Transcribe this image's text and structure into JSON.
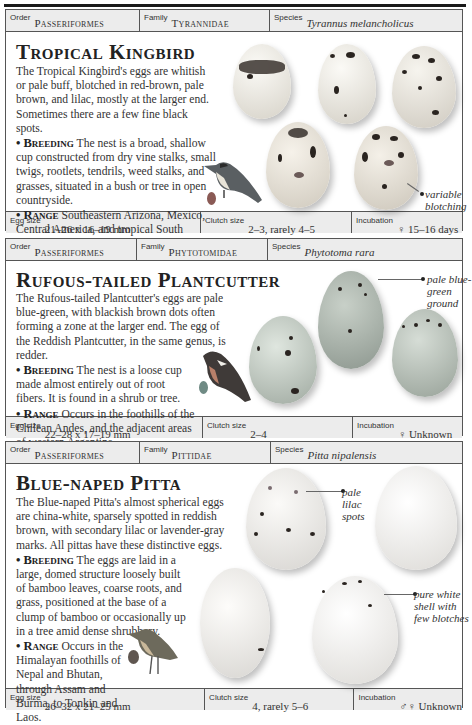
{
  "entries": [
    {
      "order_label": "Order",
      "order": "Passeriformes",
      "family_label": "Family",
      "family": "Tyrannidae",
      "species_label": "Species",
      "species": "Tyrannus melancholicus",
      "title": "Tropical Kingbird",
      "description": "The Tropical Kingbird's eggs are whitish or pale buff, blotched in red-brown, pale brown, and lilac, mostly at the larger end. Sometimes there are a few fine black spots.",
      "breeding_label": "• Breeding",
      "breeding": " The nest is a broad, shallow cup constructed from dry vine stalks, small twigs, rootlets, tendrils, weed stalks, and grasses, situated in a bush or tree in open countryside.",
      "range_label": "• Range",
      "range": " Southeastern Arizona, Mexico, Central America, and tropical South America to northern Argentina.",
      "annotations": [
        "variable blotching"
      ],
      "egg_size_label": "Egg size",
      "egg_size": "21–26 x 16–19 mm",
      "clutch_size_label": "Clutch size",
      "clutch_size": "2–3, rarely 4–5",
      "incubation_label": "Incubation",
      "incubation": "♀ 15–16 days"
    },
    {
      "order_label": "Order",
      "order": "Passeriformes",
      "family_label": "Family",
      "family": "Phytotomidae",
      "species_label": "Species",
      "species": "Phytotoma rara",
      "title": "Rufous-tailed Plantcutter",
      "description": "The Rufous-tailed Plantcutter's eggs are pale blue-green, with blackish brown dots often forming a zone at the larger end. The egg of the Reddish Plantcutter, in the same genus, is redder.",
      "breeding_label": "• Breeding",
      "breeding": " The nest is a loose cup made almost entirely out of root fibers. It is found in a shrub or tree.",
      "range_label": "• Range",
      "range": " Occurs in the foothills of the Chilean Andes, and the adjacent areas of western Argentina.",
      "annotations": [
        "pale blue-green ground"
      ],
      "egg_size_label": "Egg size",
      "egg_size": "22–28 x 17–19 mm",
      "clutch_size_label": "Clutch size",
      "clutch_size": "2–4",
      "incubation_label": "Incubation",
      "incubation": "♀ Unknown"
    },
    {
      "order_label": "Order",
      "order": "Passeriformes",
      "family_label": "Family",
      "family": "Pittidae",
      "species_label": "Species",
      "species": "Pitta nipalensis",
      "title": "Blue-naped Pitta",
      "description": "The Blue-naped Pitta's almost spherical eggs are china-white, sparsely spotted in reddish brown, with secondary lilac or lavender-gray marks. All pittas have these distinctive eggs.",
      "breeding_label": "• Breeding",
      "breeding": " The eggs are laid in a large, domed structure loosely built of bamboo leaves, coarse roots, and grass, positioned at the base of a clump of bamboo or occasionally up in a tree amid dense shrubbery.",
      "range_label": "• Range",
      "range": " Occurs in the Himalayan foothills of Nepal and Bhutan, through Assam and Burma, to Tonkin and Laos.",
      "annotations": [
        "pale lilac spots",
        "pure white shell with few blotches"
      ],
      "egg_size_label": "Egg size",
      "egg_size": "26–32 x 21–25 mm",
      "clutch_size_label": "Clutch size",
      "clutch_size": "4, rarely 5–6",
      "incubation_label": "Incubation",
      "incubation": "♂♀ Unknown"
    }
  ]
}
